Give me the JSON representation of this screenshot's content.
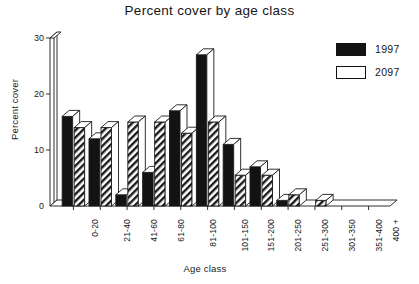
{
  "chart_data": {
    "type": "bar",
    "title": "Percent cover by age class",
    "xlabel": "Age class",
    "ylabel": "Percent cover",
    "categories": [
      "0-20",
      "21-40",
      "41-60",
      "61-80",
      "81-100",
      "101-150",
      "151-200",
      "201-250",
      "251-300",
      "301-350",
      "351-400",
      "400 +"
    ],
    "series": [
      {
        "name": "1997",
        "style": "solid-black",
        "color": "#131313",
        "values": [
          16,
          12,
          2,
          6,
          17,
          27,
          11,
          7,
          1,
          0,
          0,
          0
        ]
      },
      {
        "name": "2097",
        "style": "diagonal-hatch",
        "color": "#ffffff",
        "values": [
          14,
          14,
          15,
          15,
          13,
          15,
          5.5,
          5.5,
          2,
          1,
          0,
          0
        ]
      }
    ],
    "ylim": [
      0,
      30
    ],
    "yticks": [
      0,
      10,
      20,
      30
    ],
    "ytick_labels": [
      "0",
      "10",
      "20",
      "30"
    ],
    "grid": false,
    "legend_position": "top-right",
    "legend_entries": [
      "1997",
      "2097"
    ]
  },
  "legend": {
    "items": [
      {
        "label": "1997"
      },
      {
        "label": "2097"
      }
    ]
  }
}
